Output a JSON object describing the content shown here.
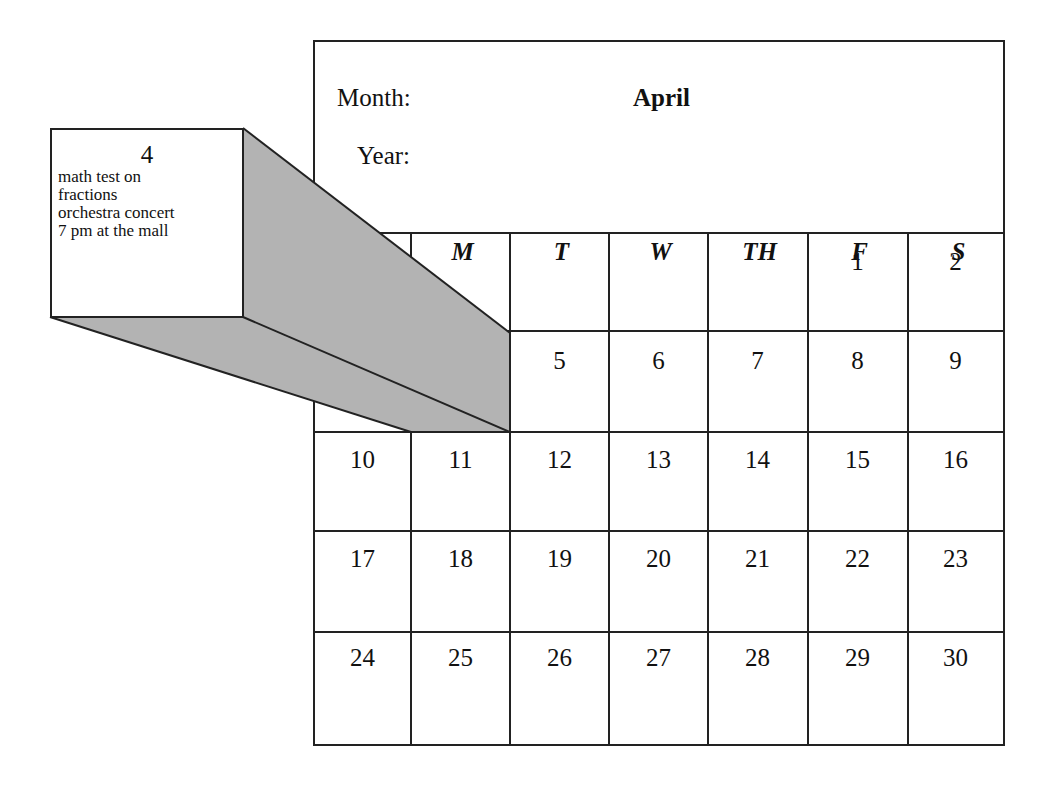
{
  "calendar": {
    "month_label": "Month:",
    "month_value": "April",
    "year_label": "Year:",
    "year_value": "",
    "weekdays": [
      "S",
      "M",
      "T",
      "W",
      "TH",
      "F",
      "S"
    ],
    "weeks": [
      [
        "",
        "",
        "",
        "",
        "",
        "1",
        "2"
      ],
      [
        "",
        "",
        "5",
        "6",
        "7",
        "8",
        "9"
      ],
      [
        "10",
        "11",
        "12",
        "13",
        "14",
        "15",
        "16"
      ],
      [
        "17",
        "18",
        "19",
        "20",
        "21",
        "22",
        "23"
      ],
      [
        "24",
        "25",
        "26",
        "27",
        "28",
        "29",
        "30"
      ]
    ]
  },
  "callout": {
    "day": "4",
    "notes": [
      "math test on",
      "fractions",
      "orchestra concert",
      "7 pm at the mall"
    ],
    "extrusion_color": "#b3b3b3"
  }
}
